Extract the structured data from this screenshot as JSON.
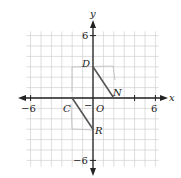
{
  "diagram": {
    "type": "coordinate-plane",
    "axes": {
      "x_label": "x",
      "y_label": "y",
      "x_range": [
        -6,
        6
      ],
      "y_range": [
        -6,
        6
      ],
      "tick_labels": {
        "x_neg": "−6",
        "x_pos": "6",
        "y_pos": "6",
        "y_neg": "−6"
      },
      "origin_label": "O",
      "minus_mark": "−"
    },
    "points": [
      {
        "name": "D",
        "x": 0,
        "y": 3
      },
      {
        "name": "N",
        "x": 2,
        "y": 0
      },
      {
        "name": "C",
        "x": -2,
        "y": 0
      },
      {
        "name": "R",
        "x": 0,
        "y": -3
      }
    ],
    "segments": [
      {
        "from": "D",
        "to": "N"
      },
      {
        "from": "C",
        "to": "R"
      }
    ],
    "colors": {
      "grid": "#c8c8c8",
      "axis": "#222222",
      "segment": "#555555",
      "sketch": "#bdbdbd"
    }
  }
}
